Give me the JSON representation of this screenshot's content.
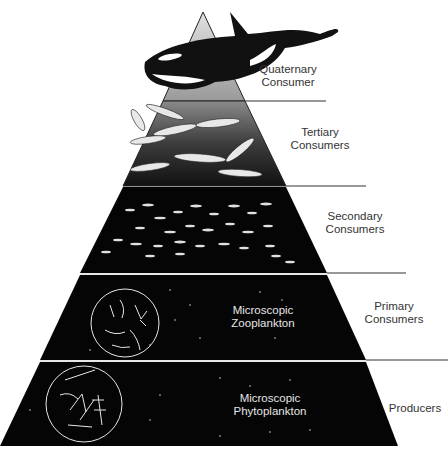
{
  "diagram": {
    "type": "ecological food pyramid (marine)",
    "levels": [
      {
        "id": "quaternary",
        "label_line1": "Quaternary",
        "label_line2": "Consumer",
        "organism": "orca (killer whale)",
        "fill": "#bdbdbd"
      },
      {
        "id": "tertiary",
        "label_line1": "Tertiary",
        "label_line2": "Consumers",
        "organism": "large fish / salmon",
        "fill": "#3a3a3a"
      },
      {
        "id": "secondary",
        "label_line1": "Secondary",
        "label_line2": "Consumers",
        "organism": "small fish school",
        "fill": "#050505"
      },
      {
        "id": "primary",
        "label_line1": "Primary",
        "label_line2": "Consumers",
        "inner_line1": "Microscopic",
        "inner_line2": "Zooplankton",
        "fill": "#050505"
      },
      {
        "id": "producers",
        "label_line1": "Producers",
        "inner_line1": "Microscopic",
        "inner_line2": "Phytoplankton",
        "fill": "#050505"
      }
    ]
  }
}
